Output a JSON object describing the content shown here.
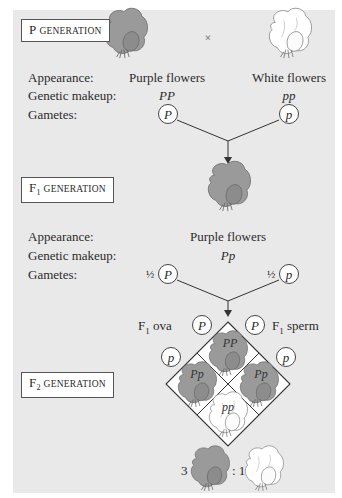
{
  "diagram": {
    "colors": {
      "background_panel": "#e9e9e9",
      "purple_flower_fill": "#9a9a9a",
      "purple_flower_stroke": "#6f6f6f",
      "white_flower_fill": "#ffffff",
      "white_flower_stroke": "#888888",
      "line": "#333333"
    },
    "row_labels": {
      "appearance": "Appearance:",
      "genetic_makeup": "Genetic makeup:",
      "gametes": "Gametes:"
    },
    "p_generation": {
      "label_prefix": "P",
      "label_suffix": "GENERATION",
      "cross_symbol": "×",
      "parents": [
        {
          "appearance": "Purple flowers",
          "genotype": "PP",
          "gamete": "P",
          "flower": "purple-flower-icon"
        },
        {
          "appearance": "White flowers",
          "genotype": "pp",
          "gamete": "p",
          "flower": "white-flower-icon"
        }
      ]
    },
    "f1_generation": {
      "label_prefix": "F",
      "label_sub": "1",
      "label_suffix": "GENERATION",
      "appearance": "Purple flowers",
      "genotype": "Pp",
      "gametes": [
        {
          "fraction": "½",
          "allele": "P"
        },
        {
          "fraction": "½",
          "allele": "p"
        }
      ]
    },
    "punnett": {
      "ova_label_prefix": "F",
      "ova_label_sub": "1",
      "ova_label_suffix": " ova",
      "sperm_label_prefix": "F",
      "sperm_label_sub": "1",
      "sperm_label_suffix": " sperm",
      "ova_alleles": [
        "P",
        "p"
      ],
      "sperm_alleles": [
        "P",
        "p"
      ],
      "cells": [
        {
          "position": "top",
          "genotype": "PP",
          "phenotype": "purple"
        },
        {
          "position": "left",
          "genotype": "Pp",
          "phenotype": "purple"
        },
        {
          "position": "right",
          "genotype": "Pp",
          "phenotype": "purple"
        },
        {
          "position": "bottom",
          "genotype": "pp",
          "phenotype": "white"
        }
      ]
    },
    "f2_generation": {
      "label_prefix": "F",
      "label_sub": "2",
      "label_suffix": "GENERATION",
      "ratio_purple": "3",
      "ratio_white": ": 1"
    }
  }
}
